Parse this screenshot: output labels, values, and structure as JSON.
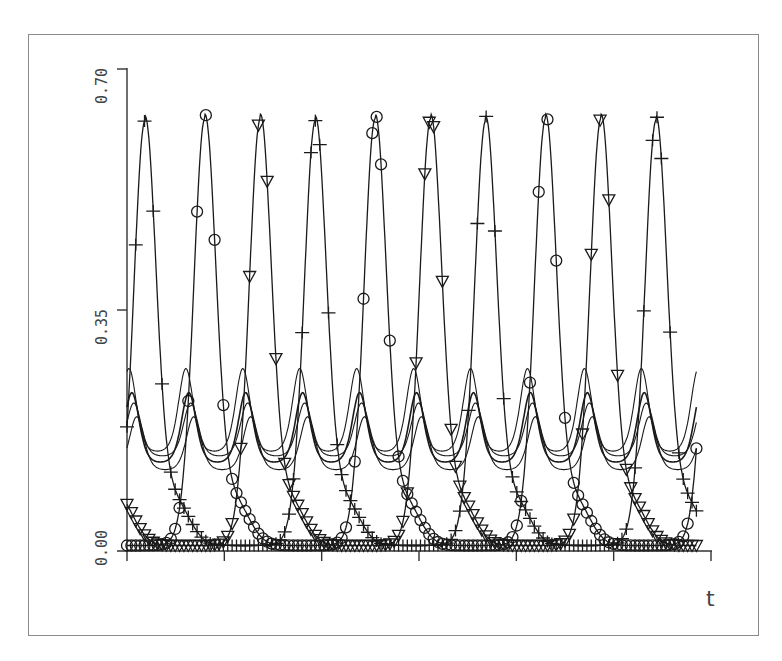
{
  "chart_data": {
    "type": "line",
    "title": "",
    "xlabel": "t",
    "ylabel": "",
    "xlim": [
      0,
      6
    ],
    "ylim": [
      0.0,
      0.7
    ],
    "yticks": [
      0.0,
      0.35,
      0.7
    ],
    "ytick_labels": [
      "0.00",
      "0.35",
      "0.70"
    ],
    "xticks": [
      0,
      1,
      2,
      3,
      4,
      5,
      6
    ],
    "xtick_labels": [
      "",
      "",
      "",
      "",
      "",
      "",
      ""
    ],
    "grid": false,
    "legend": null,
    "t_end": 5.85,
    "large_series_model": {
      "period": 1.75,
      "min": 0.008,
      "max": 0.625,
      "sharpness": 6
    },
    "small_series_model": {
      "period": 0.585
    },
    "series": [
      {
        "name": "plus-series",
        "marker": "plus",
        "phase_peak_t": 0.185,
        "peak": 0.625
      },
      {
        "name": "circle-series",
        "marker": "circle",
        "phase_peak_t": 0.8,
        "peak": 0.628
      },
      {
        "name": "triangle-series",
        "marker": "triangle-down",
        "phase_peak_t": 1.37,
        "peak": 0.628
      },
      {
        "name": "thin-curve-1",
        "marker": "none",
        "phase_peak_t": 0.02,
        "low": 0.14,
        "high": 0.265,
        "weight": 1.1
      },
      {
        "name": "thin-curve-2",
        "marker": "none",
        "phase_peak_t": 0.05,
        "low": 0.125,
        "high": 0.23,
        "weight": 1.6
      },
      {
        "name": "thin-curve-3",
        "marker": "none",
        "phase_peak_t": 0.07,
        "low": 0.135,
        "high": 0.215,
        "weight": 1.1
      },
      {
        "name": "thin-curve-4",
        "marker": "none",
        "phase_peak_t": 0.1,
        "low": 0.115,
        "high": 0.195,
        "weight": 1.1
      }
    ]
  },
  "axes": {
    "x_label": "t",
    "y_tick_0": "0.00",
    "y_tick_1": "0.35",
    "y_tick_2": "0.70"
  }
}
